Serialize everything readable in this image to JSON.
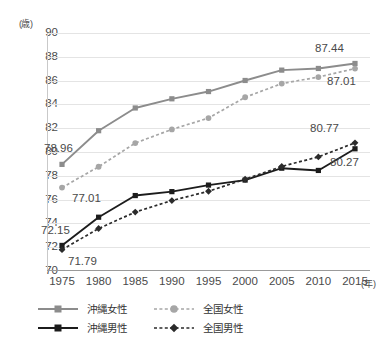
{
  "chart_data": {
    "type": "line",
    "title": "",
    "xlabel": "年",
    "ylabel": "歳",
    "x_unit": "(年)",
    "y_unit": "(歳)",
    "categories": [
      1975,
      1980,
      1985,
      1990,
      1995,
      2000,
      2005,
      2010,
      2015
    ],
    "xtick_labels": [
      "1975",
      "1980",
      "1985",
      "1990",
      "1995",
      "2000",
      "2005",
      "2010",
      "2015"
    ],
    "ytick_labels": [
      "90",
      "88",
      "86",
      "84",
      "82",
      "80",
      "78",
      "76",
      "74",
      "72",
      "70"
    ],
    "ylim": [
      70,
      90
    ],
    "ytick_step": 2,
    "grid": true,
    "legend_position": "bottom-left",
    "series": [
      {
        "name": "沖縄女性",
        "marker": "square",
        "line_style": "solid",
        "color": "#8c8c8c",
        "values": [
          78.96,
          81.79,
          83.7,
          84.47,
          85.08,
          86.01,
          86.88,
          87.02,
          87.44
        ],
        "start_label": "78.96",
        "end_label": "87.44"
      },
      {
        "name": "全国女性",
        "marker": "circle",
        "line_style": "dotted",
        "color": "#a6a6a6",
        "values": [
          77.01,
          78.76,
          80.75,
          81.9,
          82.85,
          84.6,
          85.75,
          86.3,
          87.01
        ],
        "start_label": "77.01",
        "end_label": "87.01"
      },
      {
        "name": "沖縄男性",
        "marker": "square",
        "line_style": "solid",
        "color": "#1c1c1c",
        "values": [
          72.15,
          74.52,
          76.34,
          76.67,
          77.22,
          77.64,
          78.64,
          78.45,
          80.27
        ],
        "start_label": "72.15",
        "end_label": "80.27"
      },
      {
        "name": "全国男性",
        "marker": "diamond",
        "line_style": "dotted",
        "color": "#2b2b2b",
        "values": [
          71.79,
          73.57,
          74.95,
          75.92,
          76.7,
          77.71,
          78.79,
          79.59,
          80.77
        ],
        "start_label": "71.79",
        "end_label": "80.77"
      }
    ],
    "point_labels": [
      {
        "text": "78.96",
        "series": "沖縄女性",
        "position": "left"
      },
      {
        "text": "77.01",
        "series": "全国女性",
        "position": "right-below"
      },
      {
        "text": "72.15",
        "series": "沖縄男性",
        "position": "left-above"
      },
      {
        "text": "71.79",
        "series": "全国男性",
        "position": "right-below"
      },
      {
        "text": "87.44",
        "series": "沖縄女性",
        "position": "above"
      },
      {
        "text": "87.01",
        "series": "全国女性",
        "position": "below"
      },
      {
        "text": "80.77",
        "series": "全国男性",
        "position": "above"
      },
      {
        "text": "80.27",
        "series": "沖縄男性",
        "position": "below"
      }
    ]
  },
  "legend": {
    "rows": [
      {
        "okinawa": "沖縄女性",
        "national": "全国女性"
      },
      {
        "okinawa": "沖縄男性",
        "national": "全国男性"
      }
    ]
  }
}
